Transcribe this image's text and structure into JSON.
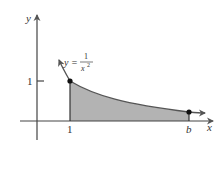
{
  "diagram": {
    "type": "area-under-curve",
    "axes": {
      "x_label": "x",
      "y_label": "y"
    },
    "ticks": {
      "x_one": "1",
      "y_one": "1",
      "x_b": "b"
    },
    "curve_label": {
      "lhs": "y =",
      "numerator": "1",
      "denominator": "x",
      "exponent": "2"
    },
    "colors": {
      "shade": "#b3b3b3",
      "curve": "#555555",
      "axis": "#444444",
      "point": "#111111"
    }
  }
}
